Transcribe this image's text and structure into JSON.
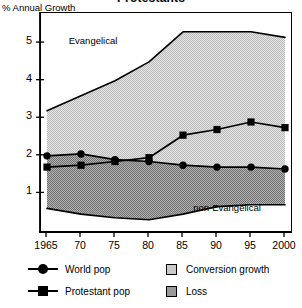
{
  "chart": {
    "title": "Protestants",
    "y_caption": "% Annual Growth",
    "area_labels": {
      "upper": "Evangelical",
      "lower": "non-Evangelical"
    }
  },
  "legend": {
    "items": [
      {
        "label": "World pop",
        "icon": "line-circle-marker"
      },
      {
        "label": "Protestant pop",
        "icon": "line-square-marker"
      },
      {
        "label": "Conversion growth",
        "icon": "light-gray-swatch"
      },
      {
        "label": "Loss",
        "icon": "dark-gray-swatch"
      }
    ]
  },
  "colors": {
    "conversion_growth": "#c9c9c9",
    "loss": "#9a9a9a",
    "line": "#000000",
    "axis": "#000000",
    "background": "#ffffff"
  },
  "chart_data": {
    "type": "area",
    "title": "Protestants",
    "xlabel": "",
    "ylabel": "% Annual Growth",
    "xlim": [
      1965,
      2000
    ],
    "ylim": [
      0,
      5.8
    ],
    "yticks": [
      1,
      2,
      3,
      4,
      5
    ],
    "ytick_labels": [
      "1",
      "2",
      "3",
      "4",
      "5"
    ],
    "xticks": [
      1965,
      1970,
      1975,
      1980,
      1985,
      1990,
      1995,
      2000
    ],
    "xtick_labels": [
      "1965",
      "70",
      "75",
      "80",
      "85",
      "90",
      "95",
      "2000"
    ],
    "grid": false,
    "legend_position": "below",
    "x": [
      1965,
      1970,
      1975,
      1980,
      1985,
      1990,
      1995,
      2000
    ],
    "series": [
      {
        "name": "Evangelical",
        "role": "upper-band-boundary",
        "values": [
          3.2,
          3.6,
          4.0,
          4.5,
          5.3,
          5.3,
          5.3,
          5.15
        ]
      },
      {
        "name": "non-Evangelical",
        "role": "lower-band-boundary",
        "values": [
          0.6,
          0.45,
          0.35,
          0.3,
          0.45,
          0.65,
          0.7,
          0.7
        ]
      },
      {
        "name": "World pop",
        "role": "line-circle-marker",
        "values": [
          2.0,
          2.05,
          1.9,
          1.85,
          1.75,
          1.7,
          1.7,
          1.65
        ]
      },
      {
        "name": "Protestant pop",
        "role": "line-square-marker",
        "values": [
          1.7,
          1.75,
          1.85,
          1.95,
          2.55,
          2.7,
          2.9,
          2.75
        ]
      }
    ],
    "bands": [
      {
        "name": "Conversion growth",
        "between": [
          "World pop",
          "Evangelical"
        ],
        "color": "#c9c9c9"
      },
      {
        "name": "Loss",
        "between": [
          "non-Evangelical",
          "World pop"
        ],
        "color": "#9a9a9a"
      }
    ]
  }
}
